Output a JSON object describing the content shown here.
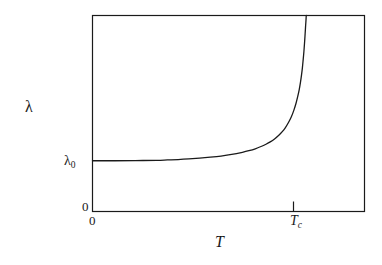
{
  "figure": {
    "kind": "line-plot",
    "background_color": "#ffffff",
    "line_color": "#1a1a1a",
    "frame_color": "#1a1a1a"
  },
  "labels": {
    "y_axis_title": "λ",
    "x_axis_title": "T",
    "lambda_zero_symbol": "λ",
    "lambda_zero_subscript": "0",
    "y_origin": "0",
    "x_origin": "0",
    "tc_symbol": "T",
    "tc_subscript": "c"
  },
  "chart_data": {
    "type": "line",
    "title": "",
    "xlabel": "T",
    "ylabel": "λ",
    "grid": false,
    "legend": null,
    "axis_frame": "box",
    "xlim": [
      0,
      1.27
    ],
    "ylim": [
      0,
      1.0
    ],
    "xticks": [
      0,
      1.0
    ],
    "xticklabels": [
      "0",
      "T_c"
    ],
    "yticks": [
      0,
      0.259
    ],
    "yticklabels": [
      "0",
      "λ_0"
    ],
    "annotations": [
      {
        "text": "λ_0",
        "x": 0,
        "y": 0.259,
        "note": "plateau value of lambda at T = 0"
      },
      {
        "text": "T_c",
        "x": 1.0,
        "y": 0,
        "note": "critical temperature, vertical asymptote"
      }
    ],
    "series": [
      {
        "name": "lambda(T)",
        "note": "penetration depth diverging at critical temperature T_c",
        "x": [
          0.0,
          0.1,
          0.2,
          0.3,
          0.35,
          0.4,
          0.45,
          0.5,
          0.55,
          0.6,
          0.65,
          0.7,
          0.73,
          0.76,
          0.79,
          0.81,
          0.83,
          0.85,
          0.87,
          0.885,
          0.9,
          0.915,
          0.928,
          0.94,
          0.95,
          0.958,
          0.965,
          0.971,
          0.976,
          0.98,
          0.984,
          0.987,
          0.99,
          0.992,
          0.994,
          0.995,
          0.996,
          0.997,
          0.998
        ],
        "y": [
          0.259,
          0.259,
          0.26,
          0.261,
          0.263,
          0.265,
          0.268,
          0.272,
          0.277,
          0.283,
          0.291,
          0.302,
          0.31,
          0.32,
          0.333,
          0.343,
          0.355,
          0.37,
          0.389,
          0.406,
          0.427,
          0.454,
          0.482,
          0.516,
          0.551,
          0.586,
          0.621,
          0.659,
          0.697,
          0.733,
          0.779,
          0.815,
          0.86,
          0.893,
          0.928,
          0.947,
          0.962,
          0.979,
          1.0
        ]
      }
    ]
  }
}
